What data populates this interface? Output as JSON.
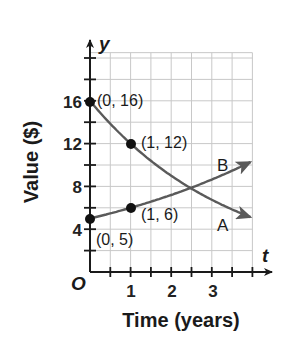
{
  "chart_data": {
    "type": "line",
    "title": "",
    "xlabel": "Time (years)",
    "ylabel": "Value ($)",
    "x_var": "t",
    "y_var": "y",
    "origin_label": "O",
    "xlim": [
      0,
      4
    ],
    "ylim": [
      0,
      20
    ],
    "grid": true,
    "x_ticks": [
      1,
      2,
      3
    ],
    "x_minor_step": 0.5,
    "y_ticks": [
      4,
      8,
      12,
      16
    ],
    "y_minor_step": 2,
    "series": [
      {
        "name": "A",
        "kind": "exponential decay",
        "formula": "y = 16(0.75)^t",
        "points": [
          {
            "x": 0,
            "y": 16,
            "label": "(0, 16)"
          },
          {
            "x": 1,
            "y": 12,
            "label": "(1, 12)"
          }
        ],
        "end": {
          "x": 4,
          "y": 5.1
        },
        "color": "#5a5a5a"
      },
      {
        "name": "B",
        "kind": "exponential growth",
        "formula": "y = 5(1.2)^t",
        "points": [
          {
            "x": 0,
            "y": 5,
            "label": "(0, 5)"
          },
          {
            "x": 1,
            "y": 6,
            "label": "(1, 6)"
          }
        ],
        "end": {
          "x": 4,
          "y": 10.4
        },
        "color": "#5a5a5a"
      }
    ],
    "intersection": {
      "x": 2.5,
      "y": 7.9
    }
  },
  "labels": {
    "ylabel": "Value ($)",
    "xlabel": "Time (years)",
    "x_var": "t",
    "y_var": "y",
    "origin": "O",
    "xtick_1": "1",
    "xtick_2": "2",
    "xtick_3": "3",
    "ytick_4": "4",
    "ytick_8": "8",
    "ytick_12": "12",
    "ytick_16": "16",
    "pt_a0": "(0, 16)",
    "pt_a1": "(1, 12)",
    "pt_b0": "(0, 5)",
    "pt_b1": "(1, 6)",
    "curve_a": "A",
    "curve_b": "B"
  }
}
